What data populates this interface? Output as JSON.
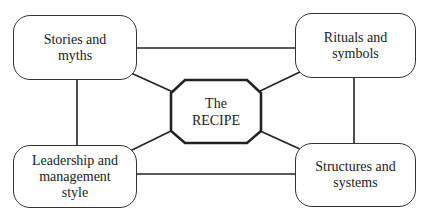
{
  "diagram": {
    "center": {
      "label": "The\nRECIPE",
      "shape": "octagon"
    },
    "nodes": [
      {
        "id": "stories",
        "label": "Stories and\nmyths",
        "position": "top-left"
      },
      {
        "id": "rituals",
        "label": "Rituals and\nsymbols",
        "position": "top-right"
      },
      {
        "id": "leadership",
        "label": "Leadership and\nmanagement\nstyle",
        "position": "bottom-left"
      },
      {
        "id": "structures",
        "label": "Structures and\nsystems",
        "position": "bottom-right"
      }
    ],
    "edges": [
      [
        "stories",
        "rituals"
      ],
      [
        "stories",
        "leadership"
      ],
      [
        "rituals",
        "structures"
      ],
      [
        "leadership",
        "structures"
      ],
      [
        "center",
        "stories"
      ],
      [
        "center",
        "rituals"
      ],
      [
        "center",
        "leadership"
      ],
      [
        "center",
        "structures"
      ]
    ],
    "colors": {
      "line": "#222222",
      "background": "#ffffff"
    }
  }
}
